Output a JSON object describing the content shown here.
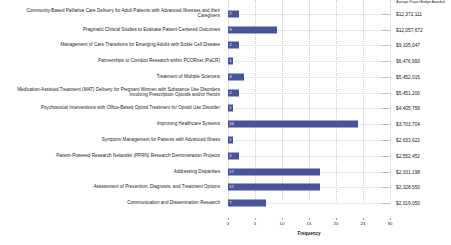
{
  "chart_data": {
    "type": "bar",
    "orientation": "horizontal",
    "title": "",
    "xlabel": "Frequency",
    "ylabel": "",
    "xlim": [
      0,
      30
    ],
    "xticks": [
      0,
      5,
      10,
      15,
      20,
      25,
      30
    ],
    "grid": true,
    "legend": "none",
    "bar_color": "#47539b",
    "categories": [
      "Community-Based Palliative Care Delivery for Adult Patients with Advanced Illnesses and their Caregivers",
      "Pragmatic Clinical Studies to Evaluate Patient-Centered Outcomes",
      "Management of Care Transitions for Emerging Adults with Sickle Cell Disease",
      "Partnerships to Conduct Research within PCORnet (PaCR)",
      "Treatment of Multiple Sclerosis",
      "Medication-Assisted Treatment (MAT) Delivery for Pregnant Women with Substance Use Disorders Involving Prescription Opioids and/or Heroin",
      "Psychosocial Interventions with Office-Based Opioid Treatment for Opioid Use Disorder",
      "Improving Healthcare Systems",
      "Symptom Management for Patients with Advanced Illness",
      "Patient-Powered Research Networks (PPRN) Research Demonstration Projects",
      "Addressing Disparities",
      "Assessment of Prevention, Diagnosis, and Treatment Options",
      "Communication and Dissemination Research"
    ],
    "values": [
      2,
      9,
      2,
      1,
      3,
      2,
      1,
      24,
      1,
      2,
      17,
      17,
      7
    ],
    "secondary_column": {
      "header": "Average Project Budget Awarded",
      "values": [
        "$12,372,111",
        "$12,057,672",
        "$9,105,047",
        "$6,476,993",
        "$5,452,015",
        "$5,451,200",
        "$4,405,758",
        "$3,703,704",
        "$2,633,622",
        "$2,552,452",
        "$2,331,198",
        "$2,328,550",
        "$2,019,050"
      ]
    }
  }
}
